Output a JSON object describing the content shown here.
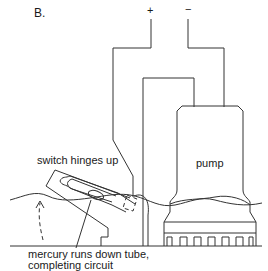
{
  "figure": {
    "label": "B.",
    "terminals": {
      "positive": "+",
      "negative": "−"
    },
    "annotations": {
      "switch": "switch hinges up",
      "pump": "pump",
      "mercury_line1": "mercury runs down tube,",
      "mercury_line2": "completing circuit"
    },
    "colors": {
      "line": "#333333",
      "background": "#ffffff"
    }
  }
}
